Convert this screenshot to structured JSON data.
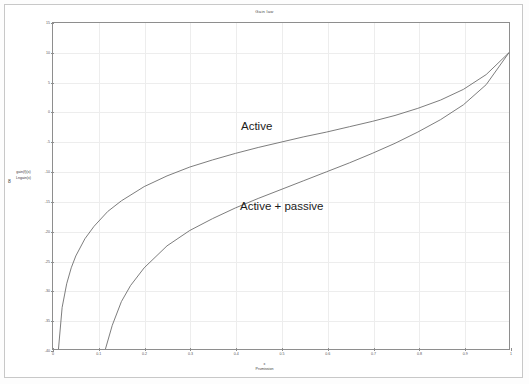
{
  "window": {
    "background": "#ffffff",
    "frame_color": "#c8c8c8"
  },
  "chart_data": {
    "type": "line",
    "title": "Gain law",
    "xlabel": "x",
    "xlabel_sub": "Prumission",
    "ylabel_line1": "gain(f)(x)",
    "ylabel_line2": "Lngain(x)",
    "ylabel_bracket": "8",
    "xlim": [
      0,
      1
    ],
    "ylim": [
      -40,
      15
    ],
    "grid": true,
    "legend": "none",
    "xticks": [
      "0",
      "0.1",
      "0.2",
      "0.3",
      "0.4",
      "0.5",
      "0.6",
      "0.7",
      "0.8",
      "0.9",
      "1"
    ],
    "xtick_values": [
      0,
      0.1,
      0.2,
      0.3,
      0.4,
      0.5,
      0.6,
      0.7,
      0.8,
      0.9,
      1
    ],
    "yticks": [
      "15",
      "10",
      "5",
      "0",
      "-5",
      "-10",
      "-15",
      "-20",
      "-25",
      "-30",
      "-35",
      "-40"
    ],
    "ytick_values": [
      15,
      10,
      5,
      0,
      -5,
      -10,
      -15,
      -20,
      -25,
      -30,
      -35,
      -40
    ],
    "annotations": [
      {
        "text": "Active",
        "x": 0.42,
        "y": -6.5
      },
      {
        "text": "Active + passive",
        "x": 0.42,
        "y": -19.5
      }
    ],
    "series": [
      {
        "name": "Active",
        "color": "#6e6e6e",
        "x": [
          0.012,
          0.02,
          0.03,
          0.04,
          0.05,
          0.07,
          0.09,
          0.12,
          0.15,
          0.2,
          0.25,
          0.3,
          0.35,
          0.4,
          0.45,
          0.5,
          0.55,
          0.6,
          0.65,
          0.7,
          0.75,
          0.8,
          0.85,
          0.9,
          0.95,
          1.0
        ],
        "y": [
          -40.0,
          -33.0,
          -29.0,
          -26.3,
          -24.3,
          -21.4,
          -19.3,
          -16.8,
          -15.0,
          -12.6,
          -10.8,
          -9.3,
          -8.1,
          -7.0,
          -6.0,
          -5.1,
          -4.2,
          -3.4,
          -2.5,
          -1.6,
          -0.6,
          0.6,
          2.0,
          3.8,
          6.3,
          10.0
        ]
      },
      {
        "name": "Active + passive",
        "color": "#6e6e6e",
        "x": [
          0.115,
          0.13,
          0.15,
          0.17,
          0.2,
          0.25,
          0.3,
          0.35,
          0.4,
          0.45,
          0.5,
          0.55,
          0.6,
          0.65,
          0.7,
          0.75,
          0.8,
          0.85,
          0.9,
          0.95,
          1.0
        ],
        "y": [
          -40.0,
          -36.0,
          -32.0,
          -29.3,
          -26.3,
          -22.6,
          -20.0,
          -18.0,
          -16.2,
          -14.6,
          -13.1,
          -11.6,
          -10.1,
          -8.6,
          -7.0,
          -5.3,
          -3.4,
          -1.3,
          1.2,
          4.6,
          10.0
        ]
      }
    ]
  }
}
